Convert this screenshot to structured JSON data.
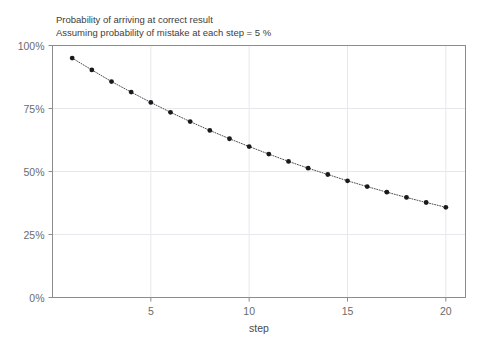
{
  "chart_data": {
    "type": "line",
    "title": "Probability of arriving at correct result",
    "subtitle": "Assuming probability of mistake at each step = 5 %",
    "title_lines": [
      "Probability of arriving at correct result",
      "Assuming probability of mistake at each step = 5 %"
    ],
    "xlabel": "step",
    "ylabel": "",
    "x": [
      1,
      2,
      3,
      4,
      5,
      6,
      7,
      8,
      9,
      10,
      11,
      12,
      13,
      14,
      15,
      16,
      17,
      18,
      19,
      20
    ],
    "values": [
      95.0,
      90.3,
      85.7,
      81.5,
      77.4,
      73.5,
      69.8,
      66.3,
      63.0,
      59.9,
      56.9,
      54.0,
      51.3,
      48.8,
      46.3,
      44.0,
      41.8,
      39.7,
      37.7,
      35.8
    ],
    "series": [
      {
        "name": "Probability of correct result",
        "values": [
          95.0,
          90.3,
          85.7,
          81.5,
          77.4,
          73.5,
          69.8,
          66.3,
          63.0,
          59.9,
          56.9,
          54.0,
          51.3,
          48.8,
          46.3,
          44.0,
          41.8,
          39.7,
          37.7,
          35.8
        ]
      }
    ],
    "xlim": [
      0,
      21
    ],
    "ylim": [
      0,
      100
    ],
    "xticks": [
      5,
      10,
      15,
      20
    ],
    "xtick_labels": [
      "5",
      "10",
      "15",
      "20"
    ],
    "yticks": [
      0,
      25,
      50,
      75,
      100
    ],
    "ytick_labels": [
      "0%",
      "25%",
      "50%",
      "75%",
      "100%"
    ],
    "grid": true,
    "grid_color": "#e8e8ec",
    "legend": false,
    "legend_position": "none",
    "marker": "circle",
    "marker_color": "#1a1a1a",
    "line_style": "dotted",
    "line_color": "#4d4d4d",
    "axis_color": "#8c8c8c",
    "frame": true
  }
}
